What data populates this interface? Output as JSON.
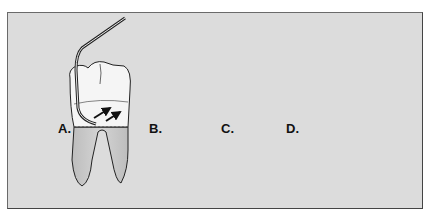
{
  "figure": {
    "panels": [
      {
        "label": "A.",
        "tooth": "molar",
        "arrow": "two diagonal arrows toward interproximal"
      },
      {
        "label": "B.",
        "tooth": "premolar",
        "arrow": "upward arrow"
      },
      {
        "label": "C.",
        "tooth": "anterior",
        "arrow": "horizontal arrow"
      },
      {
        "label": "D.",
        "tooth": "molar",
        "arrow": "horizontal sweeping arrow around tooth"
      }
    ],
    "colors": {
      "background": "#dcdcdc",
      "crown": "#f4f4f4",
      "root": "#c8c8c8",
      "instrument": "#333333",
      "border": "#555555"
    }
  }
}
